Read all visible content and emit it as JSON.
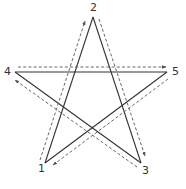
{
  "diagram": {
    "type": "pentagram",
    "vertices": [
      {
        "id": "1",
        "label": "1",
        "x": 45,
        "y": 163,
        "lx": 38,
        "ly": 172
      },
      {
        "id": "2",
        "label": "2",
        "x": 93,
        "y": 17,
        "lx": 90,
        "ly": 11
      },
      {
        "id": "3",
        "label": "3",
        "x": 141,
        "y": 163,
        "lx": 142,
        "ly": 174
      },
      {
        "id": "4",
        "label": "4",
        "x": 15,
        "y": 72,
        "lx": 4,
        "ly": 75
      },
      {
        "id": "5",
        "label": "5",
        "x": 167,
        "y": 72,
        "lx": 172,
        "ly": 75
      }
    ],
    "path_order": [
      "1",
      "2",
      "3",
      "4",
      "5",
      "1"
    ],
    "colors": {
      "line": "#333333",
      "dashed": "#555555",
      "background": "#ffffff"
    }
  }
}
